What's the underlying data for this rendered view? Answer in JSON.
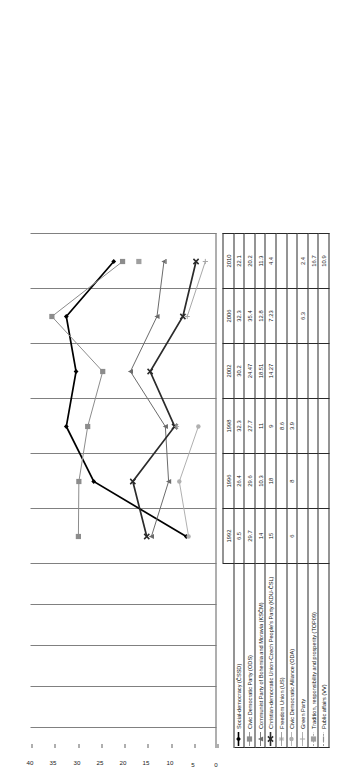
{
  "chart_data": {
    "type": "line",
    "title": "",
    "xlabel": "",
    "ylabel": "",
    "ylim": [
      0,
      40
    ],
    "yticks": [
      "0",
      "5",
      "10",
      "15",
      "20",
      "25",
      "30",
      "35",
      "40"
    ],
    "grid": true,
    "legend_position": "table-left-column",
    "categories": [
      "1992",
      "1996",
      "1998",
      "2002",
      "2006",
      "2010"
    ],
    "series": [
      {
        "name": "Social-democracy (ČSSD)",
        "marker": "diamond",
        "color": "#000000",
        "values": [
          6.5,
          26.4,
          32.3,
          30.2,
          32.3,
          22.1
        ]
      },
      {
        "name": "Civic Democratic Party (ODS)",
        "marker": "square",
        "color": "#8c8c8c",
        "values": [
          29.7,
          29.6,
          27.7,
          24.47,
          35.4,
          20.2
        ]
      },
      {
        "name": "Communist Party of Bohemia and Moravia (KSČM)",
        "marker": "triangle",
        "color": "#6b6b6b",
        "values": [
          14,
          10.3,
          11,
          18.51,
          12.8,
          11.3
        ]
      },
      {
        "name": "Christian-democratic Union-Czech People's Party (KDU-ČSL)",
        "marker": "cross-bold",
        "color": "#2b2b2b",
        "values": [
          15,
          18,
          9,
          14.27,
          7.23,
          4.4
        ]
      },
      {
        "name": "Freedom Union (US)",
        "marker": "asterisk",
        "color": "#9a9a9a",
        "values": [
          null,
          null,
          8.6,
          null,
          null,
          null
        ]
      },
      {
        "name": "Civic Democratic Alliance (ODA)",
        "marker": "dot",
        "color": "#b0b0b0",
        "values": [
          6,
          8,
          3.9,
          null,
          null,
          null
        ]
      },
      {
        "name": "Green Party",
        "marker": "plus",
        "color": "#a8a8a8",
        "values": [
          null,
          null,
          null,
          null,
          6.3,
          2.4
        ]
      },
      {
        "name": "Tradition, responsibility and prosperity (TOP09)",
        "marker": "tiny-square",
        "color": "#9f9f9f",
        "values": [
          null,
          null,
          null,
          null,
          null,
          16.7
        ]
      },
      {
        "name": "Public affairs (VV)",
        "marker": "dash",
        "color": "#8f8f8f",
        "values": [
          null,
          null,
          null,
          null,
          null,
          10.9
        ]
      }
    ]
  },
  "table": {
    "corner_label": "",
    "year_headers": [
      "1992",
      "1996",
      "1998",
      "2002",
      "2006",
      "2010"
    ],
    "rows": [
      {
        "label": "Social-democracy (ČSSD)",
        "marker": "diamond-line-black",
        "cells": [
          "6.5",
          "26.4",
          "32.3",
          "30.2",
          "32.3",
          "22.1"
        ]
      },
      {
        "label": "Civic Democratic Party (ODS)",
        "marker": "square-line-grey",
        "cells": [
          "29.7",
          "29.6",
          "27.7",
          "24.47",
          "35.4",
          "20.2"
        ]
      },
      {
        "label": "Communist Party of Bohemia and Moravia (KSČM)",
        "marker": "triangle-line-grey",
        "cells": [
          "14",
          "10.3",
          "11",
          "18.51",
          "12.8",
          "11.3"
        ]
      },
      {
        "label": "Christian-democratic Union-Czech People's Party (KDU-ČSL)",
        "marker": "cross-line-dark",
        "cells": [
          "15",
          "18",
          "9",
          "14.27",
          "7.23",
          "4.4"
        ]
      },
      {
        "label": "Freedom Union (US)",
        "marker": "asterisk-line-grey",
        "cells": [
          "",
          "",
          "8.6",
          "",
          "",
          ""
        ]
      },
      {
        "label": "Civic Democratic Alliance (ODA)",
        "marker": "dot-line-lightgrey",
        "cells": [
          "6",
          "8",
          "3.9",
          "",
          "",
          ""
        ]
      },
      {
        "label": "Green Party",
        "marker": "plus-line-grey",
        "cells": [
          "",
          "",
          "",
          "",
          "6.3",
          "2.4"
        ]
      },
      {
        "label": "Tradition, responsibility and prosperity (TOP09)",
        "marker": "tiny-square-grey",
        "cells": [
          "",
          "",
          "",
          "",
          "",
          "16.7"
        ]
      },
      {
        "label": "Public affairs (VV)",
        "marker": "dash-grey",
        "cells": [
          "",
          "",
          "",
          "",
          "",
          "10.9"
        ]
      }
    ]
  },
  "axis": {
    "labels": [
      "0",
      "5",
      "10",
      "15",
      "20",
      "25",
      "30",
      "35",
      "40"
    ]
  }
}
